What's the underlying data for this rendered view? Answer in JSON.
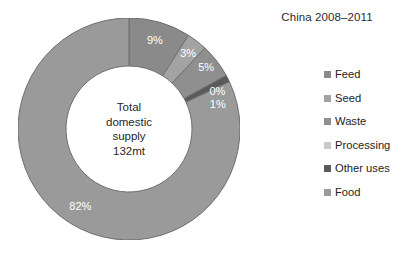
{
  "chart_data": {
    "type": "pie",
    "variant": "donut",
    "title": "China 2008–2011",
    "xlabel": "",
    "ylabel": "",
    "grid": false,
    "legend_position": "right",
    "center_annotation": [
      "Total",
      "domestic",
      "supply",
      "132mt"
    ],
    "total_label": "Total domestic supply 132mt",
    "total_value": "132mt",
    "categories": [
      "Feed",
      "Seed",
      "Waste",
      "Processing",
      "Other uses",
      "Food"
    ],
    "values": [
      9,
      3,
      5,
      0,
      1,
      82
    ],
    "value_labels": [
      "9%",
      "3%",
      "5%",
      "0%",
      "1%",
      "82%"
    ],
    "colors": [
      "#8a8a8a",
      "#a3a3a3",
      "#8f8f8f",
      "#c9c9c9",
      "#5a5a5a",
      "#9a9a9a"
    ],
    "start_angle_deg": 0,
    "direction": "clockwise",
    "slices": [
      {
        "label": "Feed",
        "value": 9,
        "value_label": "9%",
        "color": "#8a8a8a"
      },
      {
        "label": "Seed",
        "value": 3,
        "value_label": "3%",
        "color": "#a3a3a3"
      },
      {
        "label": "Waste",
        "value": 5,
        "value_label": "5%",
        "color": "#8f8f8f"
      },
      {
        "label": "Processing",
        "value": 0,
        "value_label": "0%",
        "color": "#c9c9c9"
      },
      {
        "label": "Other uses",
        "value": 1,
        "value_label": "1%",
        "color": "#5a5a5a"
      },
      {
        "label": "Food",
        "value": 82,
        "value_label": "82%",
        "color": "#9a9a9a"
      }
    ]
  },
  "legend": {
    "items": [
      {
        "label": "Feed",
        "color": "#8a8a8a"
      },
      {
        "label": "Seed",
        "color": "#a3a3a3"
      },
      {
        "label": "Waste",
        "color": "#8f8f8f"
      },
      {
        "label": "Processing",
        "color": "#c9c9c9"
      },
      {
        "label": "Other uses",
        "color": "#5a5a5a"
      },
      {
        "label": "Food",
        "color": "#9a9a9a"
      }
    ]
  },
  "style": {
    "background": "#ffffff",
    "slice_border": "#6f6f6f",
    "label_text_color": "#ffffff",
    "title_color": "#2b2b2b"
  }
}
